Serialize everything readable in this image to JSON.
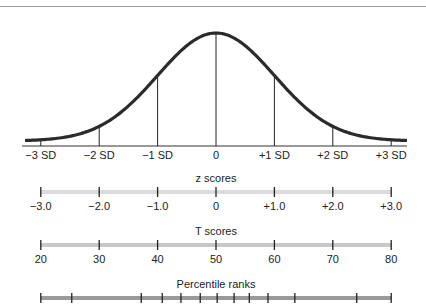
{
  "chart_data": {
    "type": "line",
    "title": "",
    "curve": {
      "mean_x": 0,
      "sd_markers": [
        -3,
        -2,
        -1,
        0,
        1,
        2,
        3
      ],
      "sd_labels": [
        "−3 SD",
        "−2 SD",
        "−1 SD",
        "0",
        "+1 SD",
        "+2 SD",
        "+3 SD"
      ],
      "xlim": [
        -3.3,
        3.3
      ]
    },
    "scales": [
      {
        "name": "z scores",
        "ticks": [
          -3.0,
          -2.0,
          -1.0,
          0,
          1.0,
          2.0,
          3.0
        ],
        "tick_labels": [
          "−3.0",
          "−2.0",
          "−1.0",
          "0",
          "+1.0",
          "+2.0",
          "+3.0"
        ],
        "bar_color": "#dcdcdc"
      },
      {
        "name": "T scores",
        "ticks": [
          20,
          30,
          40,
          50,
          60,
          70,
          80
        ],
        "tick_labels": [
          "20",
          "30",
          "40",
          "50",
          "60",
          "70",
          "80"
        ],
        "bar_color": "#c8c8c8"
      },
      {
        "name": "Percentile ranks",
        "tick_z_positions": [
          -3.0,
          -2.47,
          -1.28,
          -0.92,
          -0.6,
          -0.27,
          0.02,
          0.31,
          0.57,
          0.89,
          1.35,
          2.41,
          3.0
        ],
        "tick_labels": [],
        "bar_color": "#9a9a9a"
      }
    ],
    "xlabel": "",
    "ylabel": "",
    "grid": false,
    "legend": "none"
  },
  "colors": {
    "curve": "#2b2b2b",
    "axis": "#333333",
    "tick": "#222222",
    "rule": "#9a9a9a"
  }
}
